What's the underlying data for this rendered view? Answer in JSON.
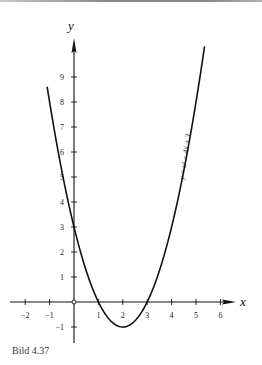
{
  "caption": "Bild 4.37",
  "chart_data": {
    "type": "line",
    "title": "",
    "function": "y = x² − 4x + 3",
    "curve_label": "y = x² − 4x + 3",
    "xlabel": "x",
    "ylabel": "y",
    "xlim": [
      -2.4,
      6.6
    ],
    "ylim": [
      -1.6,
      10.2
    ],
    "x_ticks": [
      -2,
      -1,
      0,
      1,
      2,
      3,
      4,
      5,
      6
    ],
    "x_tick_labels": [
      "−2",
      "−1",
      "",
      "1",
      "2",
      "3",
      "4",
      "5",
      "6"
    ],
    "y_ticks": [
      -1,
      1,
      2,
      3,
      4,
      5,
      6,
      7,
      8,
      9
    ],
    "y_tick_labels": [
      "−1",
      "1",
      "2",
      "3",
      "4",
      "5",
      "6",
      "7",
      "8",
      "9"
    ],
    "grid": false,
    "legend": "none",
    "series": [
      {
        "name": "y = x² − 4x + 3",
        "x": [
          -1.1,
          -1,
          -0.5,
          0,
          0.5,
          1,
          1.5,
          2,
          2.5,
          3,
          3.5,
          4,
          4.5,
          5,
          5.35
        ],
        "y": [
          9.61,
          8,
          5.25,
          3,
          1.25,
          0,
          -0.75,
          -1,
          -0.75,
          0,
          1.25,
          3,
          5.25,
          8,
          9.82
        ]
      }
    ],
    "key_points": [
      {
        "label": "y-intercept",
        "x": 0,
        "y": 3
      },
      {
        "label": "root",
        "x": 1,
        "y": 0
      },
      {
        "label": "vertex",
        "x": 2,
        "y": -1
      },
      {
        "label": "root",
        "x": 3,
        "y": 0
      }
    ]
  },
  "colors": {
    "ink": "#111111",
    "background": "#ffffff"
  }
}
